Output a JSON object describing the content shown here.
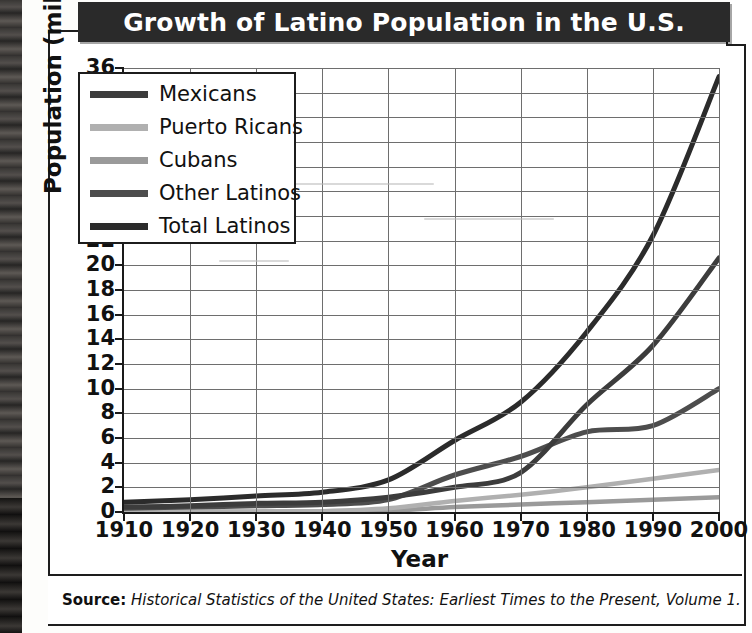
{
  "title": "Growth of Latino Population in the U.S.",
  "source": {
    "label": "Source:",
    "citation": "Historical Statistics of the United States: Earliest Times to the Present, Volume 1."
  },
  "legend": {
    "position": "top-left-inside",
    "items": [
      {
        "label": "Mexicans",
        "color": "#3c3c3c"
      },
      {
        "label": "Puerto Ricans",
        "color": "#b0b0b0"
      },
      {
        "label": "Cubans",
        "color": "#9a9a9a"
      },
      {
        "label": "Other Latinos",
        "color": "#4d4d4d"
      },
      {
        "label": "Total Latinos",
        "color": "#2b2b2b"
      }
    ]
  },
  "axes": {
    "y_ticks": [
      "36",
      "34",
      "32",
      "30",
      "28",
      "26",
      "24",
      "22",
      "20",
      "18",
      "16",
      "14",
      "12",
      "10",
      "8",
      "6",
      "4",
      "2",
      "0"
    ],
    "x_ticks": [
      "1910",
      "1920",
      "1930",
      "1940",
      "1950",
      "1960",
      "1970",
      "1980",
      "1990",
      "2000"
    ]
  },
  "chart_data": {
    "type": "line",
    "title": "Growth of Latino Population in the U.S.",
    "xlabel": "Year",
    "ylabel": "Population (millions)",
    "x": [
      1910,
      1920,
      1930,
      1940,
      1950,
      1960,
      1970,
      1980,
      1990,
      2000
    ],
    "xlim": [
      1910,
      2000
    ],
    "ylim": [
      0,
      36
    ],
    "ytick_step": 2,
    "grid": true,
    "legend_position": "upper left",
    "series": [
      {
        "name": "Mexicans",
        "color": "#3c3c3c",
        "values": [
          0.4,
          0.5,
          0.7,
          0.8,
          1.2,
          2.0,
          3.2,
          8.7,
          13.5,
          20.6
        ]
      },
      {
        "name": "Puerto Ricans",
        "color": "#b0b0b0",
        "values": [
          0.02,
          0.03,
          0.05,
          0.07,
          0.3,
          0.9,
          1.4,
          2.0,
          2.7,
          3.4
        ]
      },
      {
        "name": "Cubans",
        "color": "#9a9a9a",
        "values": [
          0.01,
          0.02,
          0.03,
          0.04,
          0.1,
          0.4,
          0.6,
          0.8,
          1.0,
          1.2
        ]
      },
      {
        "name": "Other Latinos",
        "color": "#4d4d4d",
        "values": [
          0.3,
          0.4,
          0.5,
          0.6,
          1.0,
          3.0,
          4.5,
          6.5,
          7.0,
          10.0
        ]
      },
      {
        "name": "Total Latinos",
        "color": "#2b2b2b",
        "values": [
          0.8,
          1.0,
          1.3,
          1.6,
          2.6,
          5.8,
          8.9,
          14.6,
          22.4,
          35.3
        ]
      }
    ]
  }
}
